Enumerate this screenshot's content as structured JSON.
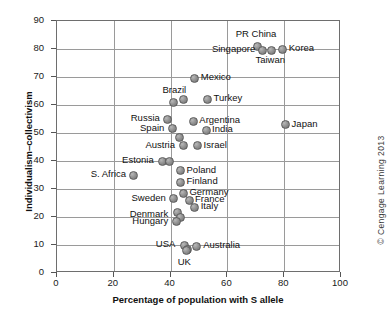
{
  "chart_data": {
    "type": "scatter",
    "title": "",
    "xlabel": "Percentage of population with S allele",
    "ylabel": "Individualism–collectivism",
    "xlim": [
      0,
      100
    ],
    "ylim": [
      0,
      90
    ],
    "xticks": [
      0,
      20,
      40,
      60,
      80,
      100
    ],
    "yticks": [
      0,
      10,
      20,
      30,
      40,
      50,
      60,
      70,
      80,
      90
    ],
    "grid": true,
    "legend": null,
    "points": [
      {
        "label": "PR China",
        "x": 70.5,
        "y": 81.0,
        "label_dx": 0,
        "label_dy": -11,
        "label_align": "center"
      },
      {
        "label": "Singapore",
        "x": 72.5,
        "y": 79.5,
        "label_dx": -7,
        "label_dy": 0,
        "label_align": "right"
      },
      {
        "label": "Taiwan",
        "x": 75.5,
        "y": 79.5,
        "label_dx": 0,
        "label_dy": 11,
        "label_align": "center"
      },
      {
        "label": "Korea",
        "x": 79.5,
        "y": 80.0,
        "label_dx": 7,
        "label_dy": 0,
        "label_align": "left"
      },
      {
        "label": "Mexico",
        "x": 48.5,
        "y": 69.5,
        "label_dx": 7,
        "label_dy": 0,
        "label_align": "left"
      },
      {
        "label": "Brazil",
        "x": 41.0,
        "y": 61.0,
        "label_dx": 2,
        "label_dy": -11,
        "label_align": "center"
      },
      {
        "label": "",
        "x": 44.5,
        "y": 62.0,
        "label_dx": 0,
        "label_dy": 0,
        "label_align": "left"
      },
      {
        "label": "Turkey",
        "x": 53.0,
        "y": 62.0,
        "label_dx": 7,
        "label_dy": 0,
        "label_align": "left"
      },
      {
        "label": "Russia",
        "x": 39.0,
        "y": 55.0,
        "label_dx": -7,
        "label_dy": 0,
        "label_align": "right"
      },
      {
        "label": "Argentina",
        "x": 48.0,
        "y": 54.0,
        "label_dx": 7,
        "label_dy": -1,
        "label_align": "left"
      },
      {
        "label": "Spain",
        "x": 40.5,
        "y": 51.5,
        "label_dx": -7,
        "label_dy": 0,
        "label_align": "right"
      },
      {
        "label": "India",
        "x": 52.5,
        "y": 51.0,
        "label_dx": 7,
        "label_dy": 0,
        "label_align": "left"
      },
      {
        "label": "Japan",
        "x": 80.5,
        "y": 53.0,
        "label_dx": 7,
        "label_dy": 0,
        "label_align": "left"
      },
      {
        "label": "",
        "x": 43.0,
        "y": 48.5,
        "label_dx": 0,
        "label_dy": 0,
        "label_align": "left"
      },
      {
        "label": "Austria",
        "x": 44.5,
        "y": 45.5,
        "label_dx": -7,
        "label_dy": 0,
        "label_align": "right"
      },
      {
        "label": "Israel",
        "x": 49.5,
        "y": 45.5,
        "label_dx": 7,
        "label_dy": 0,
        "label_align": "left"
      },
      {
        "label": "Estonia",
        "x": 37.0,
        "y": 40.0,
        "label_dx": -7,
        "label_dy": 0,
        "label_align": "right"
      },
      {
        "label": "",
        "x": 39.5,
        "y": 40.0,
        "label_dx": 0,
        "label_dy": 0,
        "label_align": "left"
      },
      {
        "label": "S. Africa",
        "x": 27.0,
        "y": 35.0,
        "label_dx": -7,
        "label_dy": 0,
        "label_align": "right"
      },
      {
        "label": "Poland",
        "x": 43.5,
        "y": 36.5,
        "label_dx": 7,
        "label_dy": 0,
        "label_align": "left"
      },
      {
        "label": "Finland",
        "x": 43.5,
        "y": 32.5,
        "label_dx": 7,
        "label_dy": 0,
        "label_align": "left"
      },
      {
        "label": "Germany",
        "x": 44.5,
        "y": 28.5,
        "label_dx": 7,
        "label_dy": 0,
        "label_align": "left"
      },
      {
        "label": "France",
        "x": 46.5,
        "y": 26.0,
        "label_dx": 7,
        "label_dy": 0,
        "label_align": "left"
      },
      {
        "label": "Italy",
        "x": 48.5,
        "y": 23.5,
        "label_dx": 7,
        "label_dy": 0,
        "label_align": "left"
      },
      {
        "label": "Sweden",
        "x": 41.0,
        "y": 26.5,
        "label_dx": -7,
        "label_dy": 0,
        "label_align": "right"
      },
      {
        "label": "Denmark",
        "x": 42.5,
        "y": 21.5,
        "label_dx": -8,
        "label_dy": 2,
        "label_align": "right"
      },
      {
        "label": "",
        "x": 43.5,
        "y": 20.0,
        "label_dx": 0,
        "label_dy": 0,
        "label_align": "left"
      },
      {
        "label": "Hungary",
        "x": 42.0,
        "y": 18.5,
        "label_dx": -7,
        "label_dy": 1,
        "label_align": "right"
      },
      {
        "label": "USA",
        "x": 45.0,
        "y": 10.0,
        "label_dx": -8,
        "label_dy": 0,
        "label_align": "right"
      },
      {
        "label": "",
        "x": 46.0,
        "y": 8.5,
        "label_dx": 0,
        "label_dy": 0,
        "label_align": "left"
      },
      {
        "label": "UK",
        "x": 45.5,
        "y": 8.0,
        "label_dx": -1,
        "label_dy": 12,
        "label_align": "center"
      },
      {
        "label": "Australia",
        "x": 49.0,
        "y": 9.5,
        "label_dx": 8,
        "label_dy": 0,
        "label_align": "left"
      }
    ]
  },
  "credit": {
    "text": "© Cengage Learning 2013"
  }
}
